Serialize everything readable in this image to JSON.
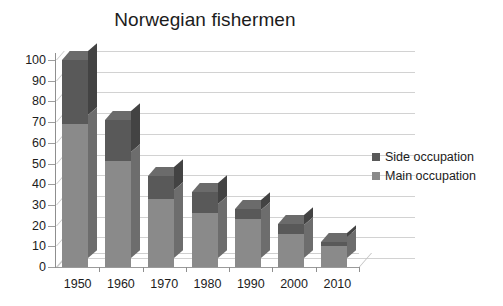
{
  "chart_data": {
    "type": "bar",
    "subtype": "stacked-column-3d",
    "title": "Norwegian fishermen",
    "xlabel": "",
    "ylabel": "",
    "categories": [
      "1950",
      "1960",
      "1970",
      "1980",
      "1990",
      "2000",
      "2010"
    ],
    "series": [
      {
        "name": "Main occupation",
        "color": "#8a8a8a",
        "values": [
          69,
          51,
          33,
          26,
          23,
          16,
          10
        ]
      },
      {
        "name": "Side occupation",
        "color": "#595959",
        "values": [
          31,
          20,
          11,
          10,
          5,
          5,
          2
        ]
      }
    ],
    "totals": [
      100,
      71,
      44,
      36,
      28,
      21,
      12
    ],
    "ylim": [
      0,
      100
    ],
    "ytick_step": 10,
    "ytick_labels": [
      "100",
      "90",
      "80",
      "70",
      "60",
      "50",
      "40",
      "30",
      "20",
      "10",
      "0"
    ],
    "grid": true,
    "legend_position": "right",
    "legend": [
      {
        "label": "Side occupation",
        "color": "#595959"
      },
      {
        "label": "Main occupation",
        "color": "#8a8a8a"
      }
    ],
    "note": "Stacked columns; segment boundary (main occupation top) and column total read from gridlines."
  }
}
